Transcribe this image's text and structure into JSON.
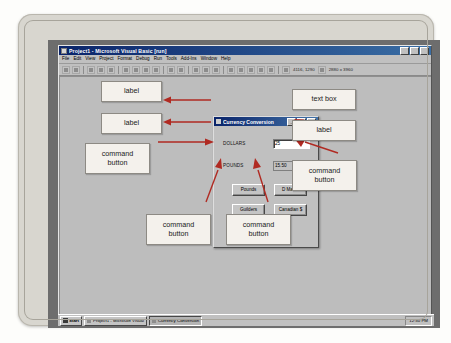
{
  "ide": {
    "title": "Project1 - Microsoft Visual Basic [run]",
    "menus": [
      "File",
      "Edit",
      "View",
      "Project",
      "Format",
      "Debug",
      "Run",
      "Tools",
      "Add-Ins",
      "Window",
      "Help"
    ],
    "toolbar": {
      "position_readout": "4116, 1290",
      "size_readout": "2880 x 3960"
    }
  },
  "app_form": {
    "title": "Currency Conversion",
    "window_buttons": {
      "minimize": "_",
      "maximize": "□",
      "close": "×"
    },
    "labels": {
      "dollars": "DOLLARS",
      "pounds": "POUNDS"
    },
    "fields": {
      "dollars_value": "25",
      "pounds_value": "15.50"
    },
    "buttons": {
      "pounds": "Pounds",
      "dmarks": "D Marks",
      "guilders": "Guilders",
      "canadian": "Canadian $"
    }
  },
  "callouts": {
    "label_top": "label",
    "label_second": "label",
    "command_button_left": [
      "command",
      "button"
    ],
    "text_box_right": "text box",
    "label_right": "label",
    "command_button_right": [
      "command",
      "button"
    ],
    "command_button_bottom_left": [
      "command",
      "button"
    ],
    "command_button_bottom_right": [
      "command",
      "button"
    ]
  },
  "taskbar": {
    "start": "Start",
    "items": [
      "Project1 - Microsoft Visual",
      "Currency Conversion"
    ],
    "clock": "12:50 PM"
  },
  "colors": {
    "titlebar": "#0a246a",
    "window_face": "#c0c0c0",
    "callout_fill": "#f4f1ec",
    "arrow_red": "#b02a22",
    "desktop": "#6d6d6d"
  }
}
